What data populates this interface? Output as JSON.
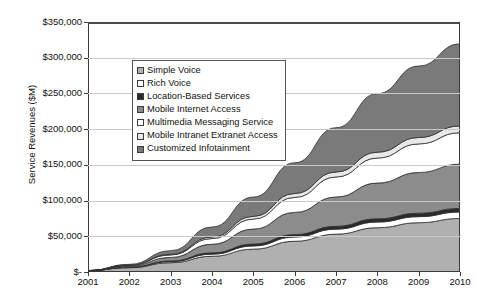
{
  "chart_data": {
    "type": "area",
    "stacked": true,
    "title": "",
    "xlabel": "",
    "ylabel": "Service Revenues ($M)",
    "x": [
      2001,
      2002,
      2003,
      2004,
      2005,
      2006,
      2007,
      2008,
      2009,
      2010
    ],
    "xtick_labels": [
      "2001",
      "2002",
      "2003",
      "2004",
      "2005",
      "2006",
      "2007",
      "2008",
      "2009",
      "2010"
    ],
    "ytick_labels": [
      "$-",
      "$50,000",
      "$100,000",
      "$150,000",
      "$200,000",
      "$250,000",
      "$300,000",
      "$350,000"
    ],
    "ytick_values": [
      0,
      50000,
      100000,
      150000,
      200000,
      250000,
      300000,
      350000
    ],
    "ylim": [
      0,
      350000
    ],
    "xlim": [
      2001,
      2010
    ],
    "grid": true,
    "legend_position": "upper-left-inside",
    "series": [
      {
        "name": "Simple Voice",
        "color": "#b0b0b0",
        "values": [
          2000,
          6000,
          13000,
          22000,
          32000,
          43000,
          53000,
          62000,
          69000,
          75000
        ]
      },
      {
        "name": "Rich Voice",
        "color": "#ffffff",
        "values": [
          0,
          500,
          1500,
          3000,
          4500,
          6000,
          7000,
          8000,
          8500,
          9000
        ]
      },
      {
        "name": "Location-Based Services",
        "color": "#2b2b2b",
        "values": [
          0,
          300,
          900,
          1800,
          2600,
          3400,
          4000,
          4500,
          4800,
          5000
        ]
      },
      {
        "name": "Mobile Internet Access",
        "color": "#8c8c8c",
        "values": [
          0,
          1500,
          5000,
          12000,
          21000,
          31000,
          41000,
          50000,
          57000,
          62000
        ]
      },
      {
        "name": "Multimedia Messaging Service",
        "color": "#ffffff",
        "values": [
          0,
          1000,
          3500,
          8000,
          14000,
          21000,
          28000,
          35000,
          40000,
          44000
        ]
      },
      {
        "name": "Mobile Intranet Extranet Access",
        "color": "#e8e8e8",
        "values": [
          0,
          200,
          900,
          2200,
          3800,
          5500,
          7000,
          8200,
          9000,
          9500
        ]
      },
      {
        "name": "Customized Infotainment",
        "color": "#7a7a7a",
        "values": [
          0,
          1200,
          5000,
          14000,
          27000,
          43000,
          62000,
          82000,
          100000,
          115000
        ]
      }
    ]
  }
}
